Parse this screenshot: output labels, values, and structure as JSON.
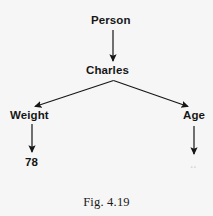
{
  "figure": {
    "caption": "Fig. 4.19",
    "background_color": "#f7f6f6",
    "ink_color": "#161616"
  },
  "nodes": {
    "person": "Person",
    "charles": "Charles",
    "weight": "Weight",
    "age": "Age",
    "weight_value": "78",
    "age_value": ".."
  },
  "edges": [
    {
      "name": "person-to-charles",
      "from": "Person",
      "to": "Charles",
      "style": "vertical-arrow"
    },
    {
      "name": "charles-to-weight",
      "from": "Charles",
      "to": "Weight",
      "style": "diagonal-arrow-left"
    },
    {
      "name": "charles-to-age",
      "from": "Charles",
      "to": "Age",
      "style": "diagonal-arrow-right"
    },
    {
      "name": "weight-to-value",
      "from": "Weight",
      "to": "78",
      "style": "vertical-arrow"
    },
    {
      "name": "age-to-value",
      "from": "Age",
      "to": "..",
      "style": "vertical-arrow"
    }
  ]
}
